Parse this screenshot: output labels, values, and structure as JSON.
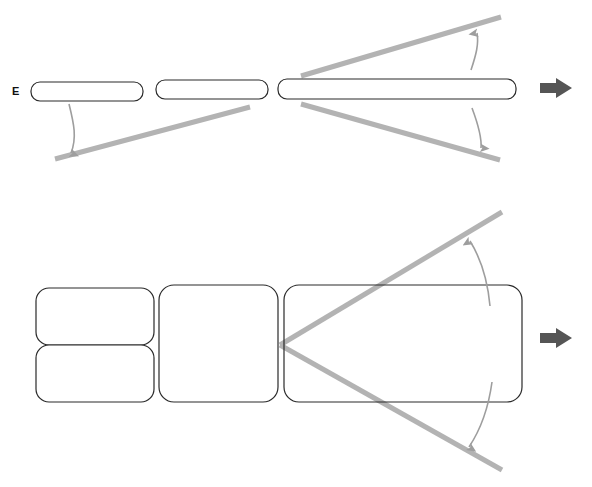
{
  "figure": {
    "background_color": "#ffffff",
    "outline_color": "#2a2a2a",
    "fill_color": "#ffffff",
    "ray_color": "#b3b3b3",
    "arc_arrow_color": "#9e9e9e",
    "flow_arrow_color": "#555555"
  },
  "labels": {
    "edge_view_label": {
      "text": "E",
      "x": 12,
      "y": 86
    }
  },
  "panels": {
    "top_row": {
      "name": "edge-view-row",
      "stroke": "#2a2a2a",
      "stroke_width": 1.2,
      "items": [
        {
          "id": "top-panel-1",
          "x": 31,
          "y": 82,
          "width": 112,
          "height": 19,
          "rx": 9,
          "label": ""
        },
        {
          "id": "top-panel-2",
          "x": 156,
          "y": 80,
          "width": 112,
          "height": 19,
          "rx": 9,
          "label": ""
        },
        {
          "id": "top-panel-3",
          "x": 278,
          "y": 79,
          "width": 238,
          "height": 20,
          "rx": 9,
          "label": ""
        }
      ]
    },
    "bottom_row": {
      "name": "front-view-row",
      "stroke": "#2a2a2a",
      "stroke_width": 1.2,
      "items": [
        {
          "id": "bottom-panel-1a",
          "x": 36,
          "y": 288,
          "width": 118,
          "height": 57,
          "rx": 13,
          "label": ""
        },
        {
          "id": "bottom-panel-1b",
          "x": 36,
          "y": 345,
          "width": 118,
          "height": 57,
          "rx": 13,
          "label": ""
        },
        {
          "id": "bottom-panel-2",
          "x": 159,
          "y": 285,
          "width": 119,
          "height": 117,
          "rx": 15,
          "label": ""
        },
        {
          "id": "bottom-panel-3",
          "x": 284,
          "y": 285,
          "width": 238,
          "height": 117,
          "rx": 15,
          "label": ""
        }
      ]
    }
  },
  "rays": {
    "color": "#b3b3b3",
    "width": 5,
    "top": [
      {
        "id": "top-ray-left-lower",
        "x1": 55,
        "y1": 159,
        "x2": 250,
        "y2": 107
      },
      {
        "id": "top-ray-right-upper",
        "x1": 301,
        "y1": 76,
        "x2": 501,
        "y2": 17
      },
      {
        "id": "top-ray-right-lower",
        "x1": 301,
        "y1": 104,
        "x2": 500,
        "y2": 160
      }
    ],
    "bottom": [
      {
        "id": "bottom-ray-upper",
        "x1": 280,
        "y1": 345,
        "x2": 502,
        "y2": 212
      },
      {
        "id": "bottom-ray-lower",
        "x1": 280,
        "y1": 345,
        "x2": 502,
        "y2": 470
      }
    ]
  },
  "arc_arrows": {
    "color": "#9e9e9e",
    "width": 1.6,
    "items": [
      {
        "id": "top-left-tilt-arc",
        "d": "M 69 104 C 74 124, 77 138, 71 153",
        "label": ""
      },
      {
        "id": "top-right-upper-tilt-arc",
        "d": "M 471 70 C 476 55, 479 44, 477 33",
        "label": ""
      },
      {
        "id": "top-right-lower-tilt-arc",
        "d": "M 472 108 C 478 124, 482 137, 481 148",
        "label": ""
      },
      {
        "id": "bottom-right-upper-tilt-arc",
        "d": "M 490 306 C 488 284, 483 262, 470 241",
        "label": ""
      },
      {
        "id": "bottom-right-lower-tilt-arc",
        "d": "M 492 382 C 489 404, 483 426, 469 447",
        "label": ""
      }
    ]
  },
  "flow_arrows": {
    "color": "#555555",
    "items": [
      {
        "id": "top-flow-arrow",
        "x": 542,
        "y": 88,
        "direction": "right"
      },
      {
        "id": "bottom-flow-arrow",
        "x": 542,
        "y": 338,
        "direction": "right"
      }
    ]
  }
}
